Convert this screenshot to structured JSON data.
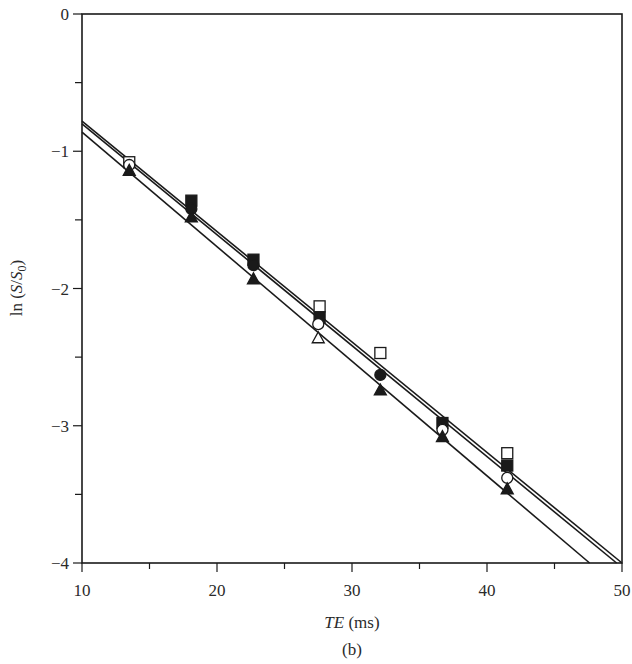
{
  "chart_data": {
    "type": "scatter",
    "title": "",
    "panel_label": "(b)",
    "xlabel": "TE (ms)",
    "xlabel_italic_part": "TE",
    "xlabel_unit_part": " (ms)",
    "ylabel": "ln (S/S0)",
    "xlim": [
      10,
      50
    ],
    "ylim": [
      -4,
      0
    ],
    "xticks": [
      10,
      20,
      30,
      40,
      50
    ],
    "xticks_minor": [
      15,
      25,
      35,
      45
    ],
    "yticks": [
      0,
      -1,
      -2,
      -3,
      -4
    ],
    "yticks_minor": [
      -0.5,
      -1.5,
      -2.5,
      -3.5
    ],
    "ytick_labels": [
      "0",
      "−1",
      "−2",
      "−3",
      "−4"
    ],
    "xtick_labels": [
      "10",
      "20",
      "30",
      "40",
      "50"
    ],
    "grid": false,
    "legend": null,
    "series": [
      {
        "name": "open square",
        "marker": "square-open",
        "points": [
          [
            13.5,
            -1.08
          ],
          [
            27.6,
            -2.13
          ],
          [
            32.1,
            -2.47
          ],
          [
            41.5,
            -3.2
          ]
        ]
      },
      {
        "name": "filled square",
        "marker": "square-filled",
        "points": [
          [
            18.1,
            -1.36
          ],
          [
            22.7,
            -1.79
          ],
          [
            27.6,
            -2.21
          ],
          [
            36.7,
            -2.98
          ],
          [
            41.5,
            -3.29
          ]
        ]
      },
      {
        "name": "open circle",
        "marker": "circle-open",
        "points": [
          [
            13.5,
            -1.1
          ],
          [
            27.5,
            -2.26
          ],
          [
            36.7,
            -3.03
          ],
          [
            41.5,
            -3.38
          ]
        ]
      },
      {
        "name": "filled circle",
        "marker": "circle-filled",
        "points": [
          [
            18.1,
            -1.42
          ],
          [
            22.7,
            -1.83
          ],
          [
            32.1,
            -2.63
          ]
        ]
      },
      {
        "name": "open triangle",
        "marker": "triangle-open",
        "points": [
          [
            27.5,
            -2.36
          ]
        ]
      },
      {
        "name": "filled triangle",
        "marker": "triangle-filled",
        "points": [
          [
            13.5,
            -1.14
          ],
          [
            18.1,
            -1.48
          ],
          [
            22.7,
            -1.93
          ],
          [
            32.1,
            -2.74
          ],
          [
            36.7,
            -3.08
          ],
          [
            41.5,
            -3.46
          ]
        ]
      }
    ],
    "fit_lines": [
      {
        "name": "fit-1",
        "x": [
          10,
          50.0
        ],
        "y": [
          -0.78,
          -4.0
        ]
      },
      {
        "name": "fit-2",
        "x": [
          10,
          49.6
        ],
        "y": [
          -0.8,
          -4.0
        ]
      },
      {
        "name": "fit-3",
        "x": [
          10,
          47.6
        ],
        "y": [
          -0.86,
          -4.0
        ]
      }
    ]
  },
  "layout": {
    "plot_left": 82,
    "plot_right": 622,
    "plot_top": 14,
    "plot_bottom": 563,
    "line_color": "#1a1a1a"
  }
}
